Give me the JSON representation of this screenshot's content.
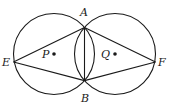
{
  "diagram": {
    "type": "geometry",
    "colors": {
      "stroke": "#1a1a1a",
      "background": "#ffffff"
    },
    "circles": [
      {
        "name": "circle-P",
        "center_label": "P",
        "cx": 54,
        "cy": 54,
        "r": 40.5
      },
      {
        "name": "circle-Q",
        "center_label": "Q",
        "cx": 115,
        "cy": 54,
        "r": 40.5
      }
    ],
    "points": {
      "A": {
        "label": "A",
        "x": 84.5,
        "y": 27.4
      },
      "B": {
        "label": "B",
        "x": 84.5,
        "y": 80.6
      },
      "E": {
        "label": "E",
        "x": 13.5,
        "y": 62
      },
      "F": {
        "label": "F",
        "x": 155.5,
        "y": 62
      },
      "P": {
        "label": "P",
        "x": 54,
        "y": 54
      },
      "Q": {
        "label": "Q",
        "x": 115,
        "y": 54
      }
    },
    "segments": [
      "EA",
      "EB",
      "AB",
      "AF",
      "BF"
    ]
  }
}
